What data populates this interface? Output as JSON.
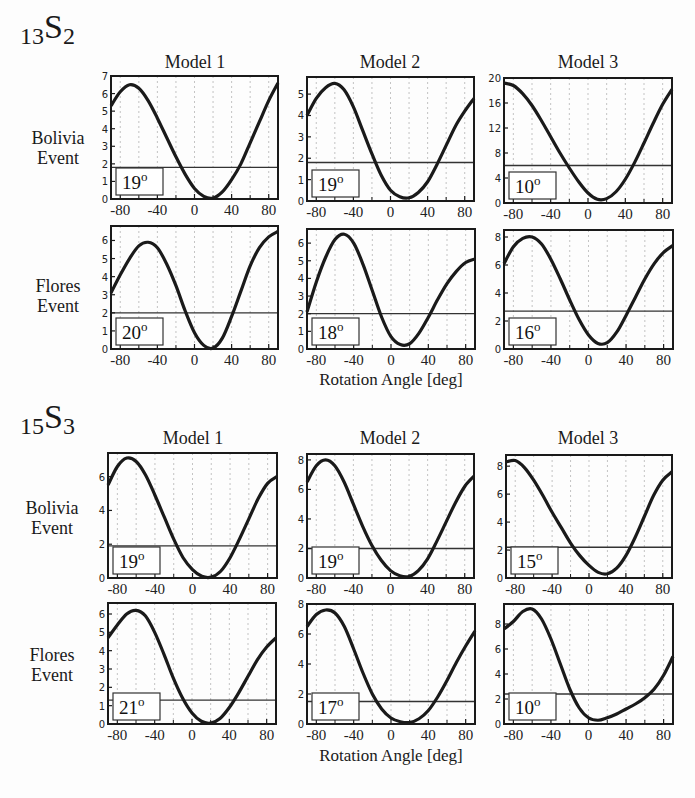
{
  "sections": [
    {
      "mode": "13",
      "letter": "S",
      "degree": "2"
    },
    {
      "mode": "15",
      "letter": "S",
      "degree": "3"
    }
  ],
  "column_titles": [
    "Model 1",
    "Model 2",
    "Model 3"
  ],
  "row_labels": {
    "bolivia": [
      "Bolivia",
      "Event"
    ],
    "flores": [
      "Flores",
      "Event"
    ]
  },
  "xlabel": "Rotation Angle [deg]",
  "chart_data": [
    {
      "type": "line",
      "section": "13S2",
      "event": "Bolivia",
      "model": "Model 1",
      "ylim": [
        0,
        7
      ],
      "yticks": [
        0,
        1,
        2,
        3,
        4,
        5,
        6,
        7
      ],
      "xlim": [
        -90,
        90
      ],
      "xticks": [
        -80,
        -40,
        0,
        40,
        80
      ],
      "threshold": 1.8,
      "best_angle": "19°",
      "x": [
        -90,
        -80,
        -70,
        -60,
        -50,
        -40,
        -30,
        -20,
        -10,
        0,
        10,
        20,
        30,
        40,
        50,
        60,
        70,
        80,
        90
      ],
      "y": [
        5.3,
        6.1,
        6.5,
        6.3,
        5.6,
        4.6,
        3.5,
        2.4,
        1.4,
        0.6,
        0.15,
        0.05,
        0.4,
        1.1,
        2.0,
        3.2,
        4.4,
        5.6,
        6.6
      ]
    },
    {
      "type": "line",
      "section": "13S2",
      "event": "Bolivia",
      "model": "Model 2",
      "ylim": [
        0,
        5.8
      ],
      "yticks": [
        0,
        1,
        2,
        3,
        4,
        5
      ],
      "xlim": [
        -90,
        90
      ],
      "xticks": [
        -80,
        -40,
        0,
        40,
        80
      ],
      "threshold": 1.8,
      "best_angle": "19°",
      "x": [
        -90,
        -80,
        -70,
        -60,
        -50,
        -40,
        -30,
        -20,
        -10,
        0,
        10,
        20,
        30,
        40,
        50,
        60,
        70,
        80,
        90
      ],
      "y": [
        4.0,
        4.8,
        5.3,
        5.5,
        5.2,
        4.4,
        3.3,
        2.2,
        1.2,
        0.5,
        0.2,
        0.15,
        0.4,
        0.9,
        1.7,
        2.6,
        3.5,
        4.2,
        4.8
      ]
    },
    {
      "type": "line",
      "section": "13S2",
      "event": "Bolivia",
      "model": "Model 3",
      "ylim": [
        0,
        20
      ],
      "yticks": [
        0,
        4,
        8,
        12,
        16,
        20
      ],
      "xlim": [
        -90,
        90
      ],
      "xticks": [
        -80,
        -40,
        0,
        40,
        80
      ],
      "threshold": 6,
      "best_angle": "10°",
      "x": [
        -90,
        -80,
        -70,
        -60,
        -50,
        -40,
        -30,
        -20,
        -10,
        0,
        10,
        20,
        30,
        40,
        50,
        60,
        70,
        80,
        90
      ],
      "y": [
        19.2,
        18.8,
        17.5,
        15.6,
        13.2,
        10.6,
        8.0,
        5.6,
        3.4,
        1.6,
        0.6,
        0.7,
        1.8,
        3.8,
        6.5,
        9.6,
        12.8,
        15.8,
        18.2
      ]
    },
    {
      "type": "line",
      "section": "13S2",
      "event": "Flores",
      "model": "Model 1",
      "ylim": [
        0,
        6.8
      ],
      "yticks": [
        0,
        1,
        2,
        3,
        4,
        5,
        6
      ],
      "xlim": [
        -90,
        90
      ],
      "xticks": [
        -80,
        -40,
        0,
        40,
        80
      ],
      "threshold": 2.0,
      "best_angle": "20°",
      "x": [
        -90,
        -80,
        -70,
        -60,
        -50,
        -40,
        -30,
        -20,
        -10,
        0,
        10,
        20,
        30,
        40,
        50,
        60,
        70,
        80,
        90
      ],
      "y": [
        3.1,
        4.1,
        5.0,
        5.7,
        5.9,
        5.6,
        4.7,
        3.5,
        2.1,
        0.9,
        0.2,
        0.05,
        0.6,
        1.8,
        3.2,
        4.6,
        5.6,
        6.2,
        6.5
      ]
    },
    {
      "type": "line",
      "section": "13S2",
      "event": "Flores",
      "model": "Model 2",
      "ylim": [
        0,
        6.8
      ],
      "yticks": [
        0,
        1,
        2,
        3,
        4,
        5,
        6
      ],
      "xlim": [
        -90,
        90
      ],
      "xticks": [
        -80,
        -40,
        0,
        40,
        80
      ],
      "threshold": 2.0,
      "best_angle": "18°",
      "x": [
        -90,
        -80,
        -70,
        -60,
        -50,
        -40,
        -30,
        -20,
        -10,
        0,
        10,
        20,
        30,
        40,
        50,
        60,
        70,
        80,
        90
      ],
      "y": [
        2.1,
        3.8,
        5.2,
        6.2,
        6.5,
        6.0,
        4.8,
        3.3,
        1.8,
        0.7,
        0.25,
        0.3,
        0.9,
        1.8,
        2.8,
        3.7,
        4.4,
        4.9,
        5.1
      ]
    },
    {
      "type": "line",
      "section": "13S2",
      "event": "Flores",
      "model": "Model 3",
      "ylim": [
        0,
        8.5
      ],
      "yticks": [
        0,
        2,
        4,
        6,
        8
      ],
      "xlim": [
        -90,
        90
      ],
      "xticks": [
        -80,
        -40,
        0,
        40,
        80
      ],
      "threshold": 2.7,
      "best_angle": "16°",
      "x": [
        -90,
        -80,
        -70,
        -60,
        -50,
        -40,
        -30,
        -20,
        -10,
        0,
        10,
        20,
        30,
        40,
        50,
        60,
        70,
        80,
        90
      ],
      "y": [
        6.1,
        7.3,
        7.9,
        8.0,
        7.5,
        6.4,
        5.0,
        3.5,
        2.1,
        1.0,
        0.4,
        0.45,
        1.2,
        2.4,
        3.7,
        5.0,
        6.1,
        6.9,
        7.4
      ]
    },
    {
      "type": "line",
      "section": "15S3",
      "event": "Bolivia",
      "model": "Model 1",
      "ylim": [
        0,
        7.4
      ],
      "yticks": [
        0,
        2,
        4,
        6
      ],
      "xlim": [
        -90,
        90
      ],
      "xticks": [
        -80,
        -40,
        0,
        40,
        80
      ],
      "threshold": 1.9,
      "best_angle": "19°",
      "x": [
        -90,
        -80,
        -70,
        -60,
        -50,
        -40,
        -30,
        -20,
        -10,
        0,
        10,
        20,
        30,
        40,
        50,
        60,
        70,
        80,
        90
      ],
      "y": [
        5.5,
        6.6,
        7.1,
        6.9,
        6.1,
        4.9,
        3.6,
        2.3,
        1.2,
        0.5,
        0.1,
        0.05,
        0.4,
        1.2,
        2.3,
        3.5,
        4.7,
        5.6,
        6.0
      ]
    },
    {
      "type": "line",
      "section": "15S3",
      "event": "Bolivia",
      "model": "Model 2",
      "ylim": [
        0,
        8.4
      ],
      "yticks": [
        0,
        2,
        4,
        6,
        8
      ],
      "xlim": [
        -90,
        90
      ],
      "xticks": [
        -80,
        -40,
        0,
        40,
        80
      ],
      "threshold": 2.0,
      "best_angle": "19°",
      "x": [
        -90,
        -80,
        -70,
        -60,
        -50,
        -40,
        -30,
        -20,
        -10,
        0,
        10,
        20,
        30,
        40,
        50,
        60,
        70,
        80,
        90
      ],
      "y": [
        6.5,
        7.6,
        8.0,
        7.6,
        6.5,
        5.0,
        3.5,
        2.2,
        1.2,
        0.5,
        0.15,
        0.1,
        0.5,
        1.3,
        2.5,
        3.8,
        5.1,
        6.2,
        6.9
      ]
    },
    {
      "type": "line",
      "section": "15S3",
      "event": "Bolivia",
      "model": "Model 3",
      "ylim": [
        0,
        8.8
      ],
      "yticks": [
        0,
        2,
        4,
        6,
        8
      ],
      "xlim": [
        -90,
        90
      ],
      "xticks": [
        -80,
        -40,
        0,
        40,
        80
      ],
      "threshold": 2.2,
      "best_angle": "15°",
      "x": [
        -90,
        -80,
        -70,
        -60,
        -50,
        -40,
        -30,
        -20,
        -10,
        0,
        10,
        20,
        30,
        40,
        50,
        60,
        70,
        80,
        90
      ],
      "y": [
        8.3,
        8.4,
        7.9,
        7.0,
        5.9,
        4.7,
        3.6,
        2.5,
        1.6,
        0.9,
        0.4,
        0.3,
        0.7,
        1.6,
        2.9,
        4.4,
        5.9,
        7.0,
        7.6
      ]
    },
    {
      "type": "line",
      "section": "15S3",
      "event": "Flores",
      "model": "Model 1",
      "ylim": [
        0,
        6.6
      ],
      "yticks": [
        0,
        1,
        2,
        3,
        4,
        5,
        6
      ],
      "xlim": [
        -90,
        90
      ],
      "xticks": [
        -80,
        -40,
        0,
        40,
        80
      ],
      "threshold": 1.3,
      "best_angle": "21°",
      "x": [
        -90,
        -80,
        -70,
        -60,
        -50,
        -40,
        -30,
        -20,
        -10,
        0,
        10,
        20,
        30,
        40,
        50,
        60,
        70,
        80,
        90
      ],
      "y": [
        4.7,
        5.4,
        6.0,
        6.2,
        5.9,
        5.0,
        3.8,
        2.5,
        1.4,
        0.6,
        0.15,
        0.05,
        0.3,
        0.9,
        1.7,
        2.6,
        3.5,
        4.2,
        4.7
      ]
    },
    {
      "type": "line",
      "section": "15S3",
      "event": "Flores",
      "model": "Model 2",
      "ylim": [
        0,
        8
      ],
      "yticks": [
        0,
        2,
        4,
        6,
        8
      ],
      "xlim": [
        -90,
        90
      ],
      "xticks": [
        -80,
        -40,
        0,
        40,
        80
      ],
      "threshold": 1.5,
      "best_angle": "17°",
      "x": [
        -90,
        -80,
        -70,
        -60,
        -50,
        -40,
        -30,
        -20,
        -10,
        0,
        10,
        20,
        30,
        40,
        50,
        60,
        70,
        80,
        90
      ],
      "y": [
        6.5,
        7.3,
        7.6,
        7.4,
        6.5,
        5.0,
        3.4,
        2.0,
        1.0,
        0.4,
        0.15,
        0.1,
        0.35,
        0.9,
        1.8,
        2.9,
        4.1,
        5.2,
        6.2
      ]
    },
    {
      "type": "line",
      "section": "15S3",
      "event": "Flores",
      "model": "Model 3",
      "ylim": [
        0,
        9.6
      ],
      "yticks": [
        0,
        2,
        4,
        6,
        8
      ],
      "xlim": [
        -90,
        90
      ],
      "xticks": [
        -80,
        -40,
        0,
        40,
        80
      ],
      "threshold": 2.4,
      "best_angle": "10°",
      "x": [
        -90,
        -80,
        -70,
        -60,
        -50,
        -40,
        -30,
        -20,
        -10,
        0,
        10,
        20,
        30,
        40,
        50,
        60,
        70,
        80,
        90
      ],
      "y": [
        7.6,
        8.2,
        9.0,
        9.2,
        8.4,
        6.8,
        4.8,
        2.8,
        1.3,
        0.5,
        0.3,
        0.5,
        0.8,
        1.2,
        1.6,
        2.1,
        2.8,
        3.9,
        5.4
      ]
    }
  ]
}
